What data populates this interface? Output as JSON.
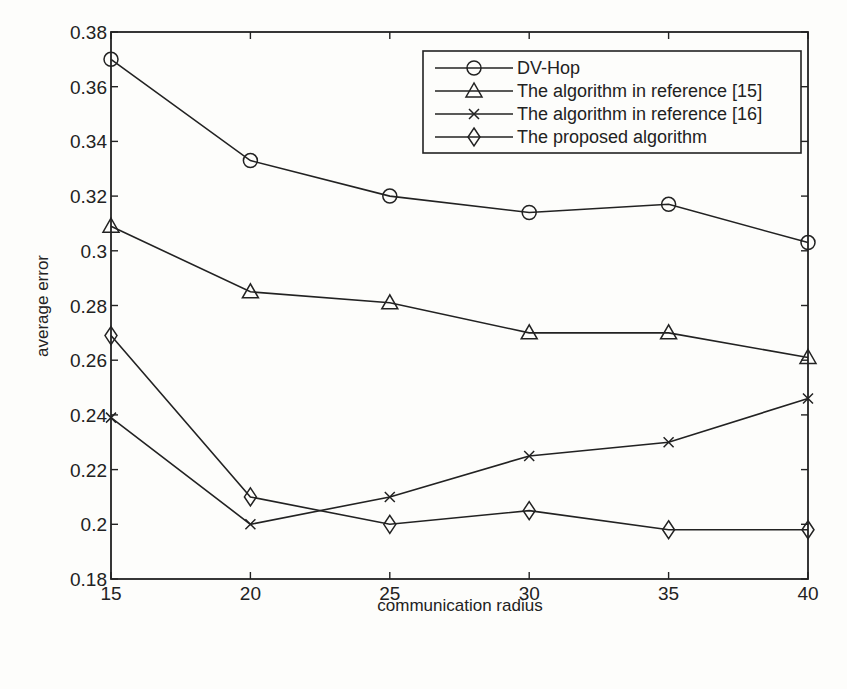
{
  "chart_data": {
    "type": "line",
    "title": "",
    "xlabel": "communication radius",
    "ylabel": "average error",
    "x": [
      15,
      20,
      25,
      30,
      35,
      40
    ],
    "xlim": [
      15,
      40
    ],
    "ylim": [
      0.18,
      0.38
    ],
    "xticks": [
      "15",
      "20",
      "25",
      "30",
      "35",
      "40"
    ],
    "yticks": [
      "0.18",
      "0.2",
      "0.22",
      "0.24",
      "0.26",
      "0.28",
      "0.3",
      "0.32",
      "0.34",
      "0.36",
      "0.38"
    ],
    "grid": false,
    "legend_position": "upper right",
    "series": [
      {
        "name": "DV-Hop",
        "marker": "circle",
        "values": [
          0.37,
          0.333,
          0.32,
          0.314,
          0.317,
          0.303
        ]
      },
      {
        "name": "The algorithm in reference [15]",
        "marker": "triangle",
        "values": [
          0.309,
          0.285,
          0.281,
          0.27,
          0.27,
          0.261
        ]
      },
      {
        "name": "The algorithm in reference [16]",
        "marker": "x",
        "values": [
          0.239,
          0.2,
          0.21,
          0.225,
          0.23,
          0.246
        ]
      },
      {
        "name": "The proposed algorithm",
        "marker": "diamond",
        "values": [
          0.269,
          0.21,
          0.2,
          0.205,
          0.198,
          0.198
        ]
      }
    ]
  },
  "legend": {
    "items": [
      {
        "label": "DV-Hop",
        "icon": "circle-marker-icon"
      },
      {
        "label": "The algorithm in reference [15]",
        "icon": "triangle-marker-icon"
      },
      {
        "label": "The algorithm in reference [16]",
        "icon": "x-marker-icon"
      },
      {
        "label": "The proposed algorithm",
        "icon": "diamond-marker-icon"
      }
    ]
  },
  "colors": {
    "line": "#222222",
    "background": "#fdfdfb"
  }
}
